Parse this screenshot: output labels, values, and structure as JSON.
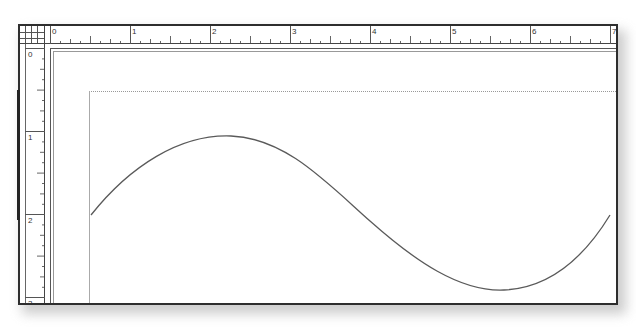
{
  "rulers": {
    "horizontal": {
      "labels": [
        "0",
        "1",
        "2",
        "3",
        "4",
        "5",
        "6",
        "7"
      ]
    },
    "vertical": {
      "labels": [
        "0",
        "1",
        "2",
        "3"
      ]
    }
  },
  "canvas": {
    "curve": "sine-wave",
    "stroke_color": "#5a5a5a",
    "margin_guide": "dotted"
  }
}
